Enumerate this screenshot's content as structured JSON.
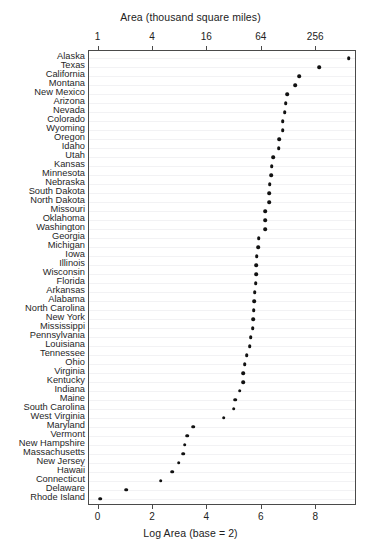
{
  "chart_data": {
    "type": "scatter",
    "title": "",
    "top_axis": {
      "label": "Area (thousand square miles)",
      "tick_labels": [
        "1",
        "4",
        "16",
        "64",
        "256"
      ],
      "tick_values": [
        0,
        2,
        4,
        6,
        8
      ]
    },
    "xlabel": "Log Area (base = 2)",
    "ylabel": "",
    "xlim": [
      -0.35,
      9.5
    ],
    "xticks": [
      0,
      2,
      4,
      6,
      8
    ],
    "xtick_labels": [
      "0",
      "2",
      "4",
      "6",
      "8"
    ],
    "grid": true,
    "grid_orientation": "horizontal",
    "legend": "none",
    "marker": "filled-circle",
    "marker_color": "#111111",
    "categories": [
      "Alaska",
      "Texas",
      "California",
      "Montana",
      "New Mexico",
      "Arizona",
      "Nevada",
      "Colorado",
      "Wyoming",
      "Oregon",
      "Idaho",
      "Utah",
      "Kansas",
      "Minnesota",
      "Nebraska",
      "South Dakota",
      "North Dakota",
      "Missouri",
      "Oklahoma",
      "Washington",
      "Georgia",
      "Michigan",
      "Iowa",
      "Illinois",
      "Wisconsin",
      "Florida",
      "Arkansas",
      "Alabama",
      "North Carolina",
      "New York",
      "Mississippi",
      "Pennsylvania",
      "Louisiana",
      "Tennessee",
      "Ohio",
      "Virginia",
      "Kentucky",
      "Indiana",
      "Maine",
      "South Carolina",
      "West Virginia",
      "Maryland",
      "Vermont",
      "New Hampshire",
      "Massachusetts",
      "New Jersey",
      "Hawaii",
      "Connecticut",
      "Delaware",
      "Rhode Island"
    ],
    "values": [
      9.196,
      8.108,
      7.377,
      7.218,
      6.93,
      6.879,
      6.843,
      6.766,
      6.764,
      6.634,
      6.618,
      6.425,
      6.366,
      6.35,
      6.286,
      6.276,
      6.268,
      6.128,
      6.127,
      6.116,
      5.882,
      5.866,
      5.815,
      5.805,
      5.804,
      5.77,
      5.747,
      5.713,
      5.703,
      5.676,
      5.664,
      5.598,
      5.562,
      5.444,
      5.369,
      5.322,
      5.313,
      5.184,
      5.022,
      4.962,
      4.604,
      3.472,
      3.262,
      3.168,
      3.107,
      2.94,
      2.709,
      2.28,
      1.009,
      0.071
    ],
    "value_unit": "log2(thousand square miles)",
    "n_points": 50
  }
}
